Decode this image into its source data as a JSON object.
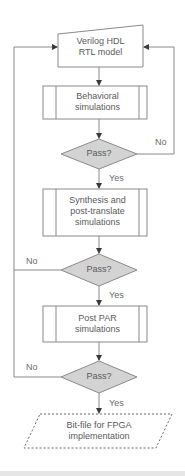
{
  "diagram": {
    "type": "flowchart",
    "colors": {
      "stroke": "#8a8a8a",
      "decision_fill": "#d3d3d3",
      "process_fill": "#ffffff",
      "text": "#5a5a5a"
    },
    "nodes": [
      {
        "id": "rtl",
        "shape": "manual-input",
        "line1": "Verilog HDL",
        "line2": "RTL model"
      },
      {
        "id": "behav",
        "shape": "predefined-process",
        "line1": "Behavioral",
        "line2": "simulations"
      },
      {
        "id": "pass1",
        "shape": "decision",
        "label": "Pass?"
      },
      {
        "id": "synth",
        "shape": "predefined-process",
        "line1": "Synthesis and",
        "line2": "post-translate",
        "line3": "simulations"
      },
      {
        "id": "pass2",
        "shape": "decision",
        "label": "Pass?"
      },
      {
        "id": "par",
        "shape": "predefined-process",
        "line1": "Post PAR",
        "line2": "simulations"
      },
      {
        "id": "pass3",
        "shape": "decision",
        "label": "Pass?"
      },
      {
        "id": "bitfile",
        "shape": "data-dashed",
        "line1": "Bit-file for FPGA",
        "line2": "implementation"
      }
    ],
    "edges": [
      {
        "from": "rtl",
        "to": "behav",
        "label": ""
      },
      {
        "from": "behav",
        "to": "pass1",
        "label": ""
      },
      {
        "from": "pass1",
        "to": "synth",
        "label": "Yes"
      },
      {
        "from": "pass1",
        "to": "rtl",
        "label": "No"
      },
      {
        "from": "synth",
        "to": "pass2",
        "label": ""
      },
      {
        "from": "pass2",
        "to": "par",
        "label": "Yes"
      },
      {
        "from": "pass2",
        "to": "rtl",
        "label": "No"
      },
      {
        "from": "par",
        "to": "pass3",
        "label": ""
      },
      {
        "from": "pass3",
        "to": "bitfile",
        "label": "Yes"
      },
      {
        "from": "pass3",
        "to": "rtl",
        "label": "No"
      }
    ]
  }
}
